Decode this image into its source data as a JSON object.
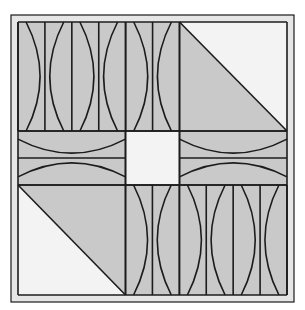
{
  "figure": {
    "width": 305,
    "height": 310,
    "colors": {
      "background": "#ffffff",
      "frame": "#e6e6e6",
      "gray": "#c9c9c9",
      "light": "#f3f3f3",
      "line": "#1c1c1c"
    },
    "frame": {
      "outer": [
        11,
        15,
        294,
        302
      ],
      "inner": [
        18,
        22,
        287,
        295
      ]
    },
    "grid": {
      "x": [
        18,
        125.5,
        179.5,
        287
      ],
      "y": [
        22,
        131,
        185,
        295
      ]
    },
    "center_square": {
      "x": 125.5,
      "y": 131,
      "w": 54,
      "h": 54,
      "fill": "light"
    },
    "triangles": [
      {
        "name": "top-right-triangle",
        "box": [
          179.5,
          22,
          287,
          131
        ],
        "diagonal": "tl-br",
        "gray_side": "bottom-left",
        "light_side": "top-right"
      },
      {
        "name": "bottom-left-triangle",
        "box": [
          18,
          185,
          125.5,
          295
        ],
        "diagonal": "tl-br",
        "gray_side": "top-right",
        "light_side": "bottom-left"
      }
    ],
    "stripe_panels": [
      {
        "name": "top-left-stripes",
        "x0": 18,
        "x1": 179.5,
        "y0": 22,
        "y1": 131,
        "count": 6
      },
      {
        "name": "bottom-right-stripes",
        "x0": 125.5,
        "x1": 287,
        "y0": 185,
        "y1": 295,
        "count": 6
      }
    ],
    "band_panels": [
      {
        "name": "left-middle-bands",
        "x0": 18,
        "x1": 125.5,
        "y0": 131,
        "y1": 185
      },
      {
        "name": "right-middle-bands",
        "x0": 179.5,
        "x1": 287,
        "y0": 131,
        "y1": 185
      }
    ]
  }
}
